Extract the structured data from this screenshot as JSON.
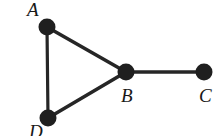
{
  "figure": {
    "type": "undirected-graph-diagram",
    "background_color": "#ffffff",
    "ink_color": "#1a1a1a",
    "edge_color": "#262626",
    "node_fill": "#1f1f1f",
    "node_radius_px": 8.5,
    "edge_width_px": 3.4,
    "width_px": 223,
    "height_px": 136
  },
  "nodes": [
    {
      "id": "A",
      "label": "A",
      "cx": 47,
      "cy": 27,
      "label_x": 27,
      "label_y": 0
    },
    {
      "id": "B",
      "label": "B",
      "cx": 126,
      "cy": 72,
      "label_x": 121,
      "label_y": 86
    },
    {
      "id": "C",
      "label": "C",
      "cx": 204,
      "cy": 72,
      "label_x": 199,
      "label_y": 86
    },
    {
      "id": "D",
      "label": "D",
      "cx": 48,
      "cy": 118,
      "label_x": 29,
      "label_y": 122
    }
  ],
  "edges": [
    {
      "id": "edge-A-D",
      "from": "A",
      "to": "D",
      "x1": 47,
      "y1": 27,
      "x2": 48,
      "y2": 118
    },
    {
      "id": "edge-A-B",
      "from": "A",
      "to": "B",
      "x1": 47,
      "y1": 27,
      "x2": 126,
      "y2": 72
    },
    {
      "id": "edge-D-B",
      "from": "D",
      "to": "B",
      "x1": 48,
      "y1": 118,
      "x2": 126,
      "y2": 72
    },
    {
      "id": "edge-B-C",
      "from": "B",
      "to": "C",
      "x1": 126,
      "y1": 72,
      "x2": 204,
      "y2": 72
    }
  ],
  "labels": {
    "A": "A",
    "B": "B",
    "C": "C",
    "D": "D"
  }
}
